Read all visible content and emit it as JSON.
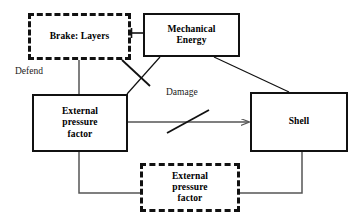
{
  "diagram": {
    "type": "block-flow-diagram",
    "canvas": {
      "width": 362,
      "height": 224,
      "background": "#ffffff"
    },
    "stroke_color": "#111111",
    "connector_color": "#555555",
    "nodes": [
      {
        "id": "brake-layers",
        "label": "Brake: Layers",
        "style": "dashed",
        "x": 28,
        "y": 13,
        "width": 103,
        "height": 47,
        "font_size": 9.5
      },
      {
        "id": "mechanical-energy",
        "label": "Mechanical\nEnergy",
        "style": "solid",
        "x": 143,
        "y": 13,
        "width": 97,
        "height": 44,
        "font_size": 9.5
      },
      {
        "id": "external-pressure-factor-main",
        "label": "External\npressure\nfactor",
        "style": "solid",
        "x": 32,
        "y": 94,
        "width": 96,
        "height": 58,
        "font_size": 9.5
      },
      {
        "id": "shell",
        "label": "Shell",
        "style": "solid",
        "x": 250,
        "y": 92,
        "width": 98,
        "height": 60,
        "font_size": 9.5
      },
      {
        "id": "external-pressure-factor-ghost",
        "label": "External\npressure\nfactor",
        "style": "dashed",
        "x": 140,
        "y": 163,
        "width": 100,
        "height": 49,
        "font_size": 9.5
      }
    ],
    "edge_labels": [
      {
        "id": "defend",
        "text": "Defend",
        "x": 15,
        "y": 66,
        "font_size": 9.5
      },
      {
        "id": "damage",
        "text": "Damage",
        "x": 166,
        "y": 87,
        "font_size": 9.5
      }
    ],
    "edges": [
      {
        "id": "brake-to-mechanical",
        "from": "brake-layers",
        "to": "mechanical-energy",
        "kind": "t-bar-connector"
      },
      {
        "id": "brake-to-external-pressure",
        "from": "brake-layers",
        "to": "external-pressure-factor-main",
        "kind": "vertical-line"
      },
      {
        "id": "mechanical-to-external-pressure",
        "from": "mechanical-energy",
        "to": "external-pressure-factor-main",
        "kind": "diagonal-line-struck"
      },
      {
        "id": "mechanical-to-shell",
        "from": "mechanical-energy",
        "to": "shell",
        "kind": "diagonal-line"
      },
      {
        "id": "external-pressure-to-shell",
        "from": "external-pressure-factor-main",
        "to": "shell",
        "kind": "arrow-struck",
        "label": "Damage"
      },
      {
        "id": "external-pressure-to-ghost",
        "from": "external-pressure-factor-main",
        "to": "external-pressure-factor-ghost",
        "kind": "orthogonal-line"
      },
      {
        "id": "shell-to-ghost",
        "from": "shell",
        "to": "external-pressure-factor-ghost",
        "kind": "orthogonal-line"
      }
    ]
  }
}
